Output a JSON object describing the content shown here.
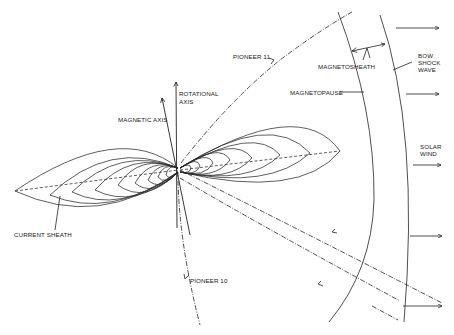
{
  "diagram": {
    "labels": {
      "pioneer11": "PIONEER 11",
      "pioneer10": "PIONEER 10",
      "rotational_axis_1": "ROTATIONAL",
      "rotational_axis_2": "AXIS",
      "magnetic_axis": "MAGNETIC AXIS",
      "magnetosheath": "MAGNETOSHEATH",
      "magnetopause": "MAGNETOPAUSE",
      "bow_1": "BOW",
      "bow_2": "SHOCK",
      "bow_3": "WAVE",
      "solar_1": "SOLAR",
      "solar_2": "WIND",
      "current_sheath": "CURRENT SHEATH"
    },
    "solar_wind_arrows": 5,
    "colors": {
      "ink": "#222222",
      "background": "#ffffff"
    }
  }
}
